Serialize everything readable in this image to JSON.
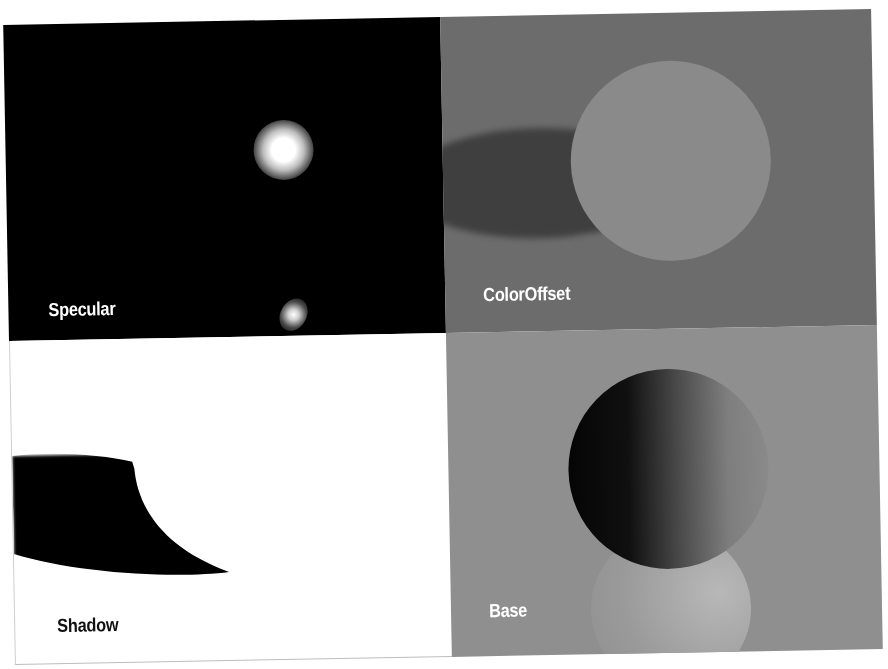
{
  "panels": {
    "specular": {
      "label": "Specular",
      "background": "#000000"
    },
    "color_offset": {
      "label": "ColorOffset",
      "background": "#6c6c6c"
    },
    "shadow": {
      "label": "Shadow",
      "background": "#ffffff"
    },
    "base": {
      "label": "Base",
      "background": "#8f8f8f"
    }
  }
}
